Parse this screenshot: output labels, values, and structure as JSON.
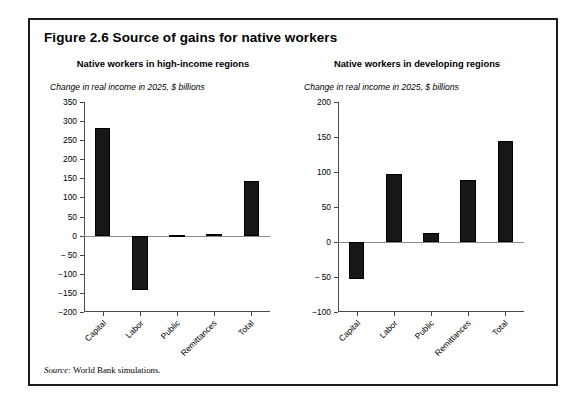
{
  "figure": {
    "title": "Figure 2.6  Source of gains for native workers",
    "source_label": "Source:",
    "source_text": " World Bank simulations."
  },
  "chart_data": [
    {
      "type": "bar",
      "title": "Native workers in high-income regions",
      "ylabel": "Change in real income in 2025, $ billions",
      "xlabel": "",
      "categories": [
        "Capital",
        "Labor",
        "Public",
        "Remittances",
        "Total"
      ],
      "values": [
        283,
        -143,
        2,
        3,
        142
      ],
      "ylim": [
        -200,
        350
      ],
      "yticks": [
        350,
        300,
        250,
        200,
        150,
        100,
        50,
        0,
        -50,
        -100,
        -150,
        -200
      ],
      "ytick_labels": [
        "350",
        "300",
        "250",
        "200",
        "150",
        "100",
        "50",
        "0",
        "− 50",
        "−100",
        "−150",
        "−200"
      ],
      "grid": false,
      "legend": "none",
      "bar_color": "#171717"
    },
    {
      "type": "bar",
      "title": "Native workers in developing regions",
      "ylabel": "Change in real income in 2025, $ billions",
      "xlabel": "",
      "categories": [
        "Capital",
        "Labor",
        "Public",
        "Remittances",
        "Total"
      ],
      "values": [
        -53,
        97,
        13,
        88,
        144
      ],
      "ylim": [
        -100,
        200
      ],
      "yticks": [
        200,
        150,
        100,
        50,
        0,
        -50,
        -100
      ],
      "ytick_labels": [
        "200",
        "150",
        "100",
        "50",
        "0",
        "− 50",
        "−100"
      ],
      "grid": false,
      "legend": "none",
      "bar_color": "#171717"
    }
  ]
}
